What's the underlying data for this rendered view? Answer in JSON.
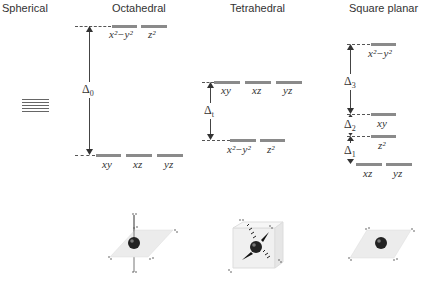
{
  "titles": {
    "spherical": "Spherical",
    "octahedral": "Octahedral",
    "tetrahedral": "Tetrahedral",
    "square_planar": "Square planar"
  },
  "octahedral": {
    "upper_orbitals": [
      "x²−y²",
      "z²"
    ],
    "lower_orbitals": [
      "xy",
      "xz",
      "yz"
    ],
    "splitting_label": "Δ",
    "splitting_sub": "0"
  },
  "tetrahedral": {
    "upper_orbitals": [
      "xy",
      "xz",
      "yz"
    ],
    "lower_orbitals": [
      "x²−y²",
      "z²"
    ],
    "splitting_label": "Δ",
    "splitting_sub": "t"
  },
  "square_planar": {
    "levels": [
      {
        "orbitals": [
          "x²−y²"
        ]
      },
      {
        "orbitals": [
          "xy"
        ]
      },
      {
        "orbitals": [
          "z²"
        ]
      },
      {
        "orbitals": [
          "xz",
          "yz"
        ]
      }
    ],
    "splittings": [
      {
        "label": "Δ",
        "sub": "3"
      },
      {
        "label": "Δ",
        "sub": "2"
      },
      {
        "label": "Δ",
        "sub": "1"
      }
    ]
  },
  "spherical": {
    "degenerate_lines": 5
  },
  "colors": {
    "level_bar": "#8a8a8a",
    "text": "#333333",
    "ligand_plane": "#e8e8e8",
    "metal_atom": "#222222"
  }
}
